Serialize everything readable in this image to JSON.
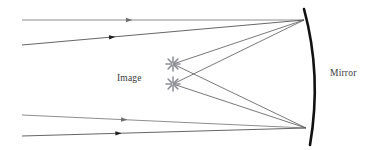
{
  "diagram": {
    "labels": {
      "image": "Image",
      "mirror": "Mirror"
    },
    "colors": {
      "background": "#ffffff",
      "ray": "#6e6e6e",
      "ray_dark": "#4a4a4a",
      "reflected_ray": "#555555",
      "mirror": "#111111",
      "starburst": "#8c8c96",
      "label_text": "#3a3a3a"
    },
    "mirror": {
      "name": "concave-mirror-arc",
      "path": "M 304 9 Q 322 75 310 145",
      "stroke_width": 2.6
    },
    "focus_points": [
      {
        "name": "upper-mirror-reflection-point",
        "x": 304,
        "y": 20
      },
      {
        "name": "lower-mirror-reflection-point",
        "x": 306,
        "y": 128
      }
    ],
    "image_points": [
      {
        "name": "image-point-upper",
        "x": 173,
        "y": 64
      },
      {
        "name": "image-point-lower",
        "x": 173,
        "y": 84
      }
    ],
    "incoming_rays": [
      {
        "name": "incoming-ray-1",
        "x1": 22,
        "y1": 20,
        "x2": 304,
        "y2": 20,
        "arrow_t": 0.38,
        "color": "#7a7a7a"
      },
      {
        "name": "incoming-ray-2",
        "x1": 22,
        "y1": 45,
        "x2": 304,
        "y2": 20,
        "arrow_t": 0.32,
        "color": "#4a4a4a"
      },
      {
        "name": "incoming-ray-3",
        "x1": 22,
        "y1": 115,
        "x2": 306,
        "y2": 128,
        "arrow_t": 0.36,
        "color": "#7a7a7a"
      },
      {
        "name": "incoming-ray-4",
        "x1": 22,
        "y1": 136,
        "x2": 306,
        "y2": 128,
        "arrow_t": 0.34,
        "color": "#4a4a4a"
      }
    ],
    "reflected_rays": [
      {
        "name": "reflected-ray-top-to-upper-image",
        "x1": 304,
        "y1": 20,
        "x2": 173,
        "y2": 64
      },
      {
        "name": "reflected-ray-top-to-lower-image",
        "x1": 304,
        "y1": 20,
        "x2": 173,
        "y2": 84
      },
      {
        "name": "reflected-ray-bottom-to-upper-image",
        "x1": 306,
        "y1": 128,
        "x2": 173,
        "y2": 64
      },
      {
        "name": "reflected-ray-bottom-to-lower-image",
        "x1": 306,
        "y1": 128,
        "x2": 173,
        "y2": 84
      }
    ],
    "label_positions": {
      "image": {
        "x": 117,
        "y": 81
      },
      "mirror": {
        "x": 330,
        "y": 76
      }
    }
  }
}
